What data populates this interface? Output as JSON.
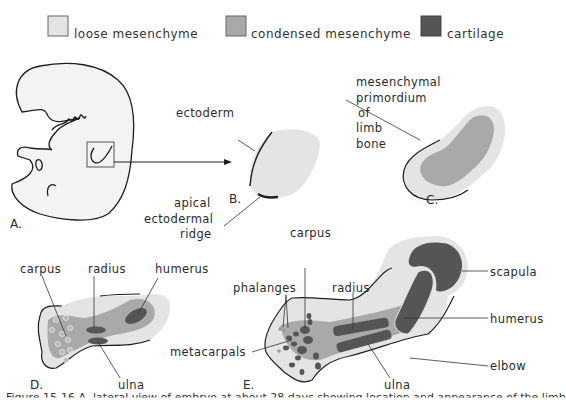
{
  "legend": {
    "items": [
      {
        "label": "loose mesenchyme",
        "color": "#e4e4e4"
      },
      {
        "label": "condensed mesenchyme",
        "color": "#a9a9a9"
      },
      {
        "label": "cartilage",
        "color": "#555555"
      }
    ]
  },
  "panels": {
    "a": {
      "label": "A."
    },
    "b": {
      "label": "B.",
      "labels": {
        "ectoderm": "ectoderm",
        "aer_1": "apical",
        "aer_2": "ectodermal",
        "aer_3": "ridge"
      }
    },
    "c": {
      "label": "C.",
      "labels": {
        "l1": "mesenchymal",
        "l2": "primordium",
        "l3": "of",
        "l4": "limb",
        "l5": "bone"
      }
    },
    "d": {
      "label": "D.",
      "labels": {
        "carpus": "carpus",
        "radius": "radius",
        "humerus": "humerus",
        "ulna": "ulna"
      }
    },
    "e": {
      "label": "E.",
      "labels": {
        "phalanges": "phalanges",
        "carpus": "carpus",
        "radius": "radius",
        "scapula": "scapula",
        "humerus": "humerus",
        "metacarpals": "metacarpals",
        "elbow": "elbow",
        "ulna": "ulna"
      }
    }
  },
  "colors": {
    "loose": "#e4e4e4",
    "condensed": "#a9a9a9",
    "cartilage": "#555555",
    "outline": "#1e1e1e"
  },
  "caption": {
    "text": "Figure 15-16  A, lateral view of embryo at about 28 days showing location and appearance of the limb"
  }
}
